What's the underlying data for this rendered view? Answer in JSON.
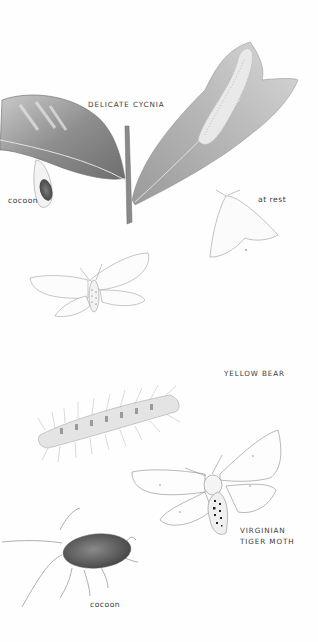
{
  "page": {
    "background": "#fefefe",
    "ink_color": "#3c3c3c"
  },
  "sections": [
    {
      "species": "DELICATE CYCNIA",
      "labels": {
        "title": "DELICATE CYCNIA",
        "cocoon": "cocoon",
        "at_rest": "at rest"
      },
      "figures": [
        "leaf-with-cocoon",
        "caterpillar-on-leaf",
        "stem",
        "moth-at-rest",
        "moth-spread-wings"
      ]
    },
    {
      "species": "YELLOW BEAR / VIRGINIAN TIGER MOTH",
      "labels": {
        "title": "YELLOW BEAR",
        "moth_line1": "VIRGINIAN",
        "moth_line2": "TIGER MOTH",
        "cocoon": "cocoon"
      },
      "figures": [
        "hairy-caterpillar",
        "moth-spread-wings-spotted",
        "hairy-cocoon"
      ]
    }
  ]
}
